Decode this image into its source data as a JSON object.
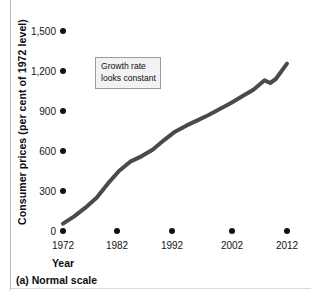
{
  "figure": {
    "caption": "(a) Normal scale",
    "annotation": {
      "line1": "Growth rate",
      "line2": "looks constant"
    }
  },
  "chart_data": {
    "type": "line",
    "title": "",
    "subtitle": "",
    "xlabel": "Year",
    "ylabel": "Consumer prices (per cent of 1972 level)",
    "xlim": [
      1972,
      2013
    ],
    "ylim": [
      0,
      1500
    ],
    "grid": false,
    "legend": null,
    "x_tick_labels": [
      "1972",
      "1982",
      "1992",
      "2002",
      "2012"
    ],
    "x_ticks": [
      1972,
      1982,
      1992,
      2002,
      2012
    ],
    "y_tick_labels": [
      "1,500",
      "1,200",
      "900",
      "600",
      "300",
      "0"
    ],
    "y_ticks": [
      1500,
      1200,
      900,
      600,
      300,
      0
    ],
    "tick_style": "dot-markers",
    "line_color": "#4a4a4a",
    "line_width": 4,
    "annotations": [
      {
        "text": "Growth rate looks constant",
        "x": 1982,
        "y": 1250
      }
    ],
    "series": [
      {
        "name": "Consumer prices (per cent of 1972 level)",
        "x": [
          1972,
          1973,
          1974,
          1975,
          1976,
          1977,
          1978,
          1979,
          1980,
          1981,
          1982,
          1983,
          1984,
          1985,
          1986,
          1987,
          1988,
          1989,
          1990,
          1991,
          1992,
          1993,
          1994,
          1995,
          1996,
          1997,
          1998,
          1999,
          2000,
          2001,
          2002,
          2003,
          2004,
          2005,
          2006,
          2007,
          2008,
          2009,
          2010,
          2011,
          2012
        ],
        "values": [
          100,
          106,
          118,
          129,
          136,
          145,
          156,
          174,
          197,
          218,
          231,
          239,
          249,
          258,
          263,
          272,
          284,
          297,
          314,
          327,
          337,
          347,
          356,
          366,
          377,
          386,
          392,
          400,
          414,
          426,
          432,
          442,
          454,
          469,
          484,
          498,
          517,
          515,
          524,
          540,
          551
        ]
      }
    ],
    "note": "Values plotted on the figure are indexed so that the rendered curve rises from about 50 at 1972 to about 1255 at 2012, with a visible flattening/dip around 2008-2009."
  },
  "plot_points": {
    "x": [
      1972,
      1974,
      1976,
      1978,
      1980,
      1982,
      1984,
      1986,
      1988,
      1990,
      1992,
      1994,
      1996,
      1998,
      2000,
      2002,
      2004,
      2006,
      2008,
      2009,
      2010,
      2012
    ],
    "y": [
      55,
      110,
      175,
      250,
      355,
      450,
      520,
      560,
      610,
      680,
      745,
      790,
      830,
      870,
      915,
      960,
      1010,
      1060,
      1130,
      1110,
      1140,
      1255
    ]
  }
}
